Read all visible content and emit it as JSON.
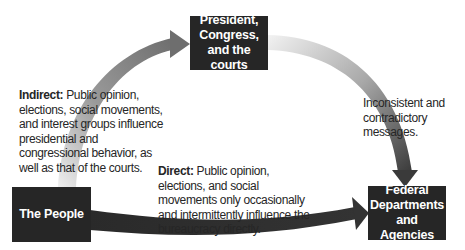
{
  "diagram": {
    "nodes": {
      "president": {
        "label": "President, Congress, and the courts"
      },
      "people": {
        "label": "The People"
      },
      "federal": {
        "label": "Federal Departments and Agencies"
      }
    },
    "edges": {
      "indirect": {
        "from": "people",
        "to": "president",
        "title": "Indirect:",
        "text": " Public opinion, elections, social movements, and interest groups influence presidential and congressional behavior, as well as that of the courts."
      },
      "inconsistent": {
        "from": "president",
        "to": "federal",
        "text": "Inconsistent and contradictory messages."
      },
      "direct": {
        "from": "people",
        "to": "federal",
        "title": "Direct:",
        "text": " Public opinion, elections, and social movements only occasionally and intermittently influence the bureaucracy directly."
      }
    },
    "colors": {
      "box": "#262626",
      "box_text": "#ffffff",
      "arrow_dark": "#2e2e2e",
      "arrow_mid": "#7a7a7a",
      "arrow_light": "#e6e6e6"
    }
  }
}
